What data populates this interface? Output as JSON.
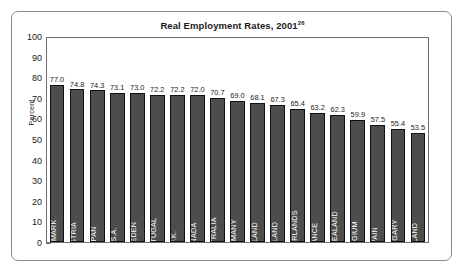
{
  "figure": {
    "title_text": "Real Employment Rates, 2001",
    "title_superscript": "26"
  },
  "chart_data": {
    "type": "bar",
    "title": "Real Employment Rates, 2001",
    "title_note": "26",
    "xlabel": "",
    "ylabel": "Percent",
    "ylim": [
      0,
      100
    ],
    "ytick_step": 10,
    "yticks": [
      0,
      10,
      20,
      30,
      40,
      50,
      60,
      70,
      80,
      90,
      100
    ],
    "grid": false,
    "legend": "none",
    "value_labels": true,
    "bar_color": "#4d4d4d",
    "bar_edge_color": "#111111",
    "bar_label_color": "#ffffff",
    "categories": [
      "DENMARK",
      "AUSTRIA",
      "JAPAN",
      "U.S.A.",
      "SWEDEN",
      "PORTUGAL",
      "U.K.",
      "CANADA",
      "AUSTRALIA",
      "GERMANY",
      "FINLAND",
      "IRELAND",
      "NETHERLANDS",
      "FRANCE",
      "NEW ZEALAND",
      "BELGIUM",
      "SPAIN",
      "HUNGARY",
      "POLAND"
    ],
    "values": [
      77.0,
      74.8,
      74.3,
      73.1,
      73.0,
      72.2,
      72.2,
      72.0,
      70.7,
      69.0,
      68.1,
      67.3,
      65.4,
      63.2,
      62.3,
      59.9,
      57.5,
      55.4,
      53.5
    ],
    "value_label_texts": [
      "77.0",
      "74.8",
      "74.3",
      "73.1",
      "73.0",
      "72.2",
      "72.2",
      "72.0",
      "70.7",
      "69.0",
      "68.1",
      "67.3",
      "65.4",
      "63.2",
      "62.3",
      "59.9",
      "57.5",
      "55.4",
      "53.5"
    ]
  }
}
